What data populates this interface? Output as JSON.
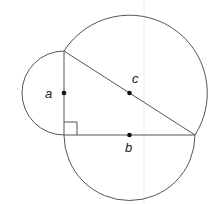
{
  "diagram": {
    "colors": {
      "stroke": "#555555",
      "point": "#111111",
      "label": "#222222",
      "background": "#ffffff",
      "guide": "#eeeeee"
    },
    "vertices": {
      "top": [
        64,
        51
      ],
      "right_angle": [
        64,
        135
      ],
      "right": [
        195,
        135
      ]
    },
    "sides": [
      {
        "id": "a",
        "label": "a",
        "midpoint": [
          64,
          93
        ],
        "radius": 42,
        "label_pos": [
          46,
          98
        ]
      },
      {
        "id": "b",
        "label": "b",
        "midpoint": [
          129.5,
          135
        ],
        "radius": 65.5,
        "label_pos": [
          125,
          152
        ]
      },
      {
        "id": "c",
        "label": "c",
        "midpoint": [
          129.5,
          93
        ],
        "radius": 77.8,
        "label_pos": [
          132,
          84
        ]
      }
    ],
    "right_angle_marker_size": 13
  }
}
